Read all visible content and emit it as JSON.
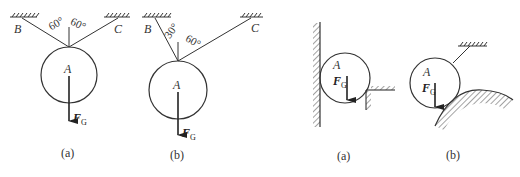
{
  "figures": [
    {
      "id": "left-a",
      "caption": "(a)",
      "body_label": "A",
      "support_left_label": "B",
      "support_right_label": "C",
      "angle_left": "60°",
      "angle_right": "60°",
      "force_label": "F",
      "force_subscript": "G"
    },
    {
      "id": "left-b",
      "caption": "(b)",
      "body_label": "A",
      "support_left_label": "B",
      "support_right_label": "C",
      "angle_left": "30°",
      "angle_right": "60°",
      "force_label": "F",
      "force_subscript": "G"
    },
    {
      "id": "right-a",
      "caption": "(a)",
      "body_label": "A",
      "force_label": "F",
      "force_subscript": "G"
    },
    {
      "id": "right-b",
      "caption": "(b)",
      "body_label": "A",
      "force_label": "F",
      "force_subscript": "G"
    }
  ],
  "colors": {
    "ink": "#333333",
    "background": "#ffffff"
  }
}
